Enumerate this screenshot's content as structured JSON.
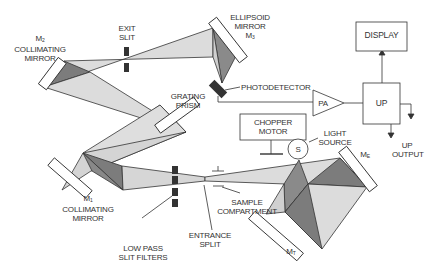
{
  "diagram": {
    "colors": {
      "beam_light": "#d8d8d8",
      "beam_dark": "#7a7a7a",
      "line": "#333333",
      "background": "#ffffff"
    },
    "labels": {
      "m2_name": "M",
      "m2_sub": "2",
      "m2_line1": "COLLIMATING",
      "m2_line2": "MIRROR",
      "exit_slit_1": "EXIT",
      "exit_slit_2": "SLIT",
      "ellipsoid_1": "ELLIPSOID",
      "ellipsoid_2": "MIRROR",
      "m3_name": "M",
      "m3_sub": "3",
      "display": "DISPLAY",
      "photodetector": "PHOTODETECTOR",
      "grating_1": "GRATING",
      "grating_2": "PRISM",
      "pa": "PA",
      "up": "UP",
      "chopper_1": "CHOPPER",
      "chopper_2": "MOTOR",
      "light_1": "LIGHT",
      "light_2": "SOURCE",
      "source_s": "S",
      "up_output_1": "UP",
      "up_output_2": "OUTPUT",
      "m1_name": "M",
      "m1_sub": "1",
      "m1_line1": "COLLIMATING",
      "m1_line2": "MIRROR",
      "sample_1": "SAMPLE",
      "sample_2": "COMPARTMENT",
      "entrance_1": "ENTRANCE",
      "entrance_2": "SPLIT",
      "lowpass_1": "LOW PASS",
      "lowpass_2": "SLIT FILTERS",
      "me_name": "M",
      "me_sub": "E",
      "mt_name": "M",
      "mt_sub": "T"
    }
  }
}
